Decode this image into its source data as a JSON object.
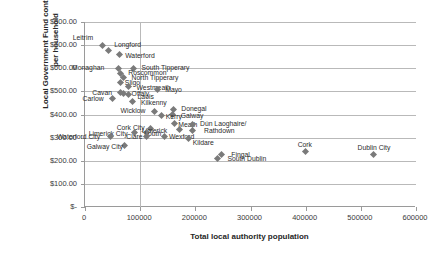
{
  "chart_data": {
    "type": "scatter",
    "title": "",
    "xlabel": "Total local authority population",
    "ylabel": "Local Government Fund contitrubion per household",
    "xlim": [
      0,
      600000
    ],
    "ylim": [
      0,
      800
    ],
    "xticks": [
      "0",
      "100000",
      "200000",
      "300000",
      "400000",
      "500000",
      "600000"
    ],
    "yticks": [
      "$800.00",
      "$700.00",
      "$600.00",
      "$500.00",
      "$400.00",
      "$300.00",
      "$200.00",
      "$100.00",
      "$-"
    ],
    "grid": "horizontal",
    "legend": "none",
    "series": [
      {
        "name": "Local authorities",
        "marker": "diamond",
        "color": "#7a7a7a",
        "points": [
          {
            "label": "Leitrim",
            "x": 32000,
            "y": 700,
            "lx": -30,
            "ly": -11
          },
          {
            "label": "Longford",
            "x": 42000,
            "y": 675,
            "lx": 6,
            "ly": -10
          },
          {
            "label": "Waterford",
            "x": 62000,
            "y": 660,
            "lx": 6,
            "ly": -2
          },
          {
            "label": "Monaghan",
            "x": 60000,
            "y": 600,
            "lx": -46,
            "ly": -4
          },
          {
            "label": "South Tipperary",
            "x": 88000,
            "y": 600,
            "lx": 8,
            "ly": -4
          },
          {
            "label": "Roscommon",
            "x": 64000,
            "y": 578,
            "lx": 8,
            "ly": -4
          },
          {
            "label": "North Tipperary",
            "x": 70000,
            "y": 560,
            "lx": 8,
            "ly": -4
          },
          {
            "label": "Sligo",
            "x": 65000,
            "y": 540,
            "lx": 4,
            "ly": -3
          },
          {
            "label": "Westmeath",
            "x": 79000,
            "y": 520,
            "lx": 8,
            "ly": -3
          },
          {
            "label": "Mayo",
            "x": 131000,
            "y": 508,
            "lx": 8,
            "ly": -4
          },
          {
            "label": "Cavan",
            "x": 64000,
            "y": 495,
            "lx": -28,
            "ly": -4
          },
          {
            "label": "Offaly",
            "x": 70000,
            "y": 492,
            "lx": 8,
            "ly": -3
          },
          {
            "label": "Laois",
            "x": 79000,
            "y": 488,
            "lx": 9,
            "ly": -1
          },
          {
            "label": "Carlow",
            "x": 50000,
            "y": 470,
            "lx": -30,
            "ly": -3
          },
          {
            "label": "Kilkenny",
            "x": 87000,
            "y": 455,
            "lx": 8,
            "ly": -3
          },
          {
            "label": "Wicklow",
            "x": 126000,
            "y": 413,
            "lx": -34,
            "ly": -4
          },
          {
            "label": "Donegal",
            "x": 160000,
            "y": 420,
            "lx": 8,
            "ly": -5
          },
          {
            "label": "Galway",
            "x": 159000,
            "y": 400,
            "lx": 8,
            "ly": -3
          },
          {
            "label": "Kerry",
            "x": 139000,
            "y": 395,
            "lx": 4,
            "ly": -3
          },
          {
            "label": "Meath",
            "x": 162000,
            "y": 360,
            "lx": 4,
            "ly": -3
          },
          {
            "label": "Dún Laoghaire/",
            "x": 194000,
            "y": 358,
            "lx": 8,
            "ly": -4
          },
          {
            "label": "Rathdown",
            "x": 194000,
            "y": 330,
            "lx": 12,
            "ly": -4
          },
          {
            "label": "Cork City",
            "x": 119000,
            "y": 340,
            "lx": -34,
            "ly": -4
          },
          {
            "label": "Limerick",
            "x": 172000,
            "y": 337,
            "lx": -38,
            "ly": -2
          },
          {
            "label": "Limerick City",
            "x": 90000,
            "y": 322,
            "lx": -46,
            "ly": -3
          },
          {
            "label": "Louth",
            "x": 111000,
            "y": 322,
            "lx": -2,
            "ly": -3
          },
          {
            "label": "Waterford City",
            "x": 47000,
            "y": 305,
            "lx": -54,
            "ly": -3
          },
          {
            "label": "Clare",
            "x": 111000,
            "y": 305,
            "lx": -20,
            "ly": -3
          },
          {
            "label": "Wexford",
            "x": 145000,
            "y": 305,
            "lx": 4,
            "ly": -3
          },
          {
            "label": "Kildare",
            "x": 188000,
            "y": 297,
            "lx": 4,
            "ly": 1
          },
          {
            "label": "Galway City",
            "x": 72000,
            "y": 265,
            "lx": -38,
            "ly": -3
          },
          {
            "label": "Cork",
            "x": 400000,
            "y": 240,
            "lx": -8,
            "ly": -11
          },
          {
            "label": "Dublin City",
            "x": 523000,
            "y": 225,
            "lx": -16,
            "ly": -11
          },
          {
            "label": "Fingal",
            "x": 247000,
            "y": 225,
            "lx": 10,
            "ly": -4
          },
          {
            "label": "South Dublin",
            "x": 240000,
            "y": 210,
            "lx": 10,
            "ly": -3
          }
        ]
      }
    ]
  }
}
